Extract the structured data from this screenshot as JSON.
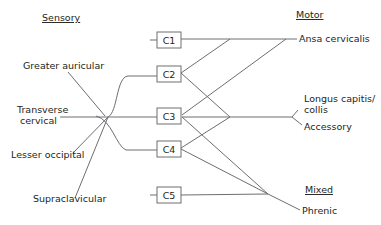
{
  "headers": {
    "sensory": "Sensory",
    "motor": "Motor",
    "mixed": "Mixed"
  },
  "sensory_nerves": {
    "greater_auricular": "Greater auricular",
    "transverse_cervical_1": "Transverse",
    "transverse_cervical_2": "cervical",
    "lesser_occipital": "Lesser occipital",
    "supraclavicular": "Supraclavicular"
  },
  "roots": [
    "C1",
    "C2",
    "C3",
    "C4",
    "C5"
  ],
  "motor_nerves": {
    "ansa_cervicalis": "Ansa cervicalis",
    "longus_1": "Longus capitis/",
    "longus_2": "collis",
    "accessory": "Accessory"
  },
  "mixed_nerves": {
    "phrenic": "Phrenic"
  },
  "colors": {
    "line": "#6d6e71",
    "text": "#231f20",
    "background": "#ffffff"
  }
}
